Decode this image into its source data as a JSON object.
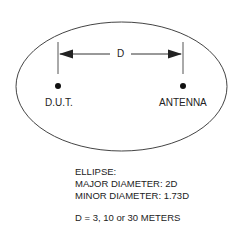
{
  "diagram": {
    "distance_label": "D",
    "left_point_label": "D.U.T.",
    "right_point_label": "ANTENNA"
  },
  "notes": {
    "title": "ELLIPSE:",
    "major": "MAJOR DIAMETER: 2D",
    "minor": "MINOR DIAMETER: 1.73D",
    "distance": "D = 3, 10 or 30 METERS"
  },
  "colors": {
    "line": "#333333",
    "background": "#ffffff"
  }
}
